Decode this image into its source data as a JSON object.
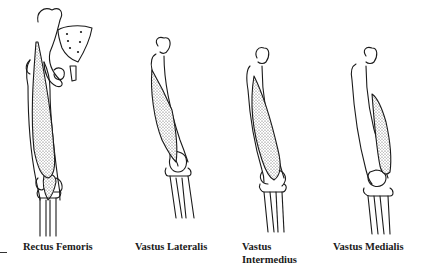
{
  "figure": {
    "panels": [
      {
        "id": "rectus-femoris",
        "label_line1": "Rectus Femoris",
        "label_line2": ""
      },
      {
        "id": "vastus-lateralis",
        "label_line1": "Vastus Lateralis",
        "label_line2": ""
      },
      {
        "id": "vastus-intermedius",
        "label_line1": "Vastus",
        "label_line2": "Intermedius"
      },
      {
        "id": "vastus-medialis",
        "label_line1": "Vastus Medialis",
        "label_line2": ""
      }
    ],
    "colors": {
      "line": "#1a1a1a",
      "stipple": "#555555",
      "background": "#ffffff"
    }
  }
}
